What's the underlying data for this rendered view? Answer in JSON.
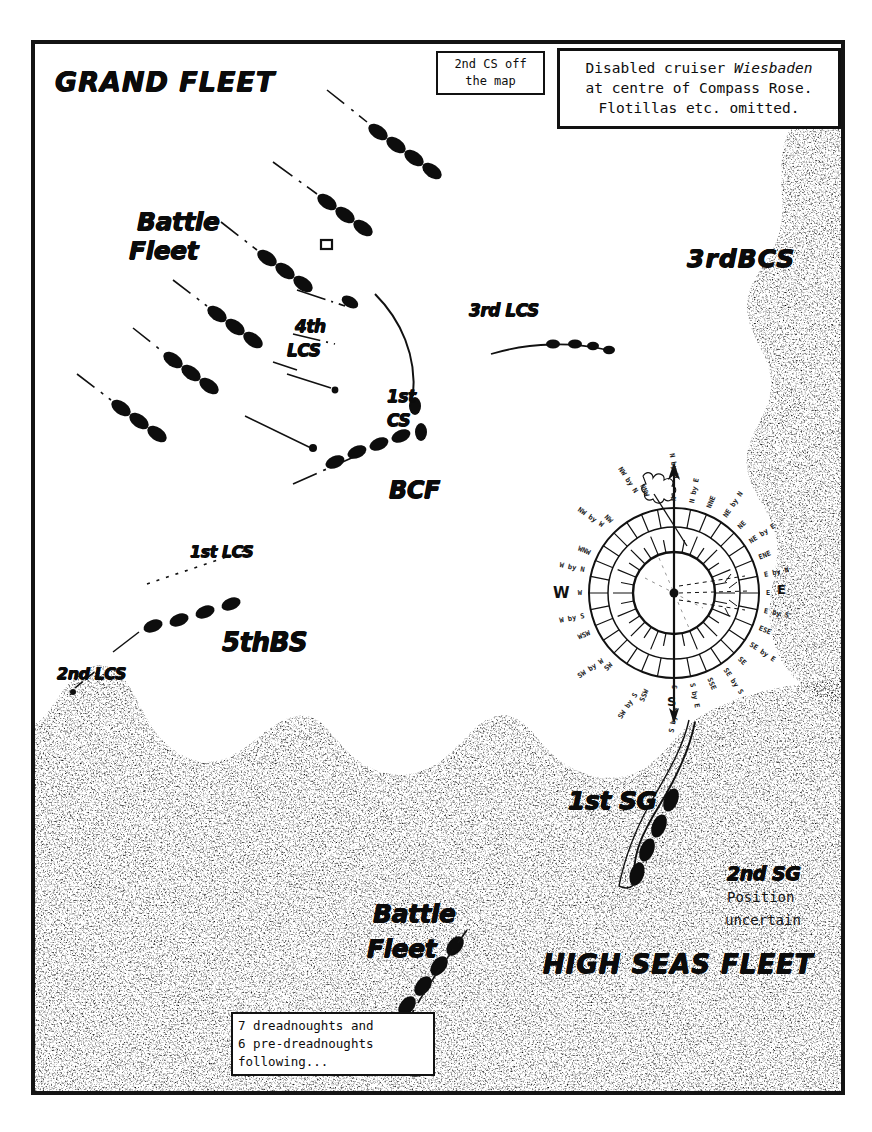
{
  "map": {
    "title": "Battle of Jutland fleet disposition map",
    "frame_color": "#141414",
    "paper_color": "#ffffff"
  },
  "notes": [
    {
      "id": "second-cs-note",
      "lines": [
        "2nd CS off",
        "the map"
      ]
    },
    {
      "id": "wiesbaden-note",
      "line1_pre": "Disabled cruiser ",
      "line1_italic": "Wiesbaden",
      "line2": "at centre of Compass Rose.",
      "line3": "Flotillas etc. omitted."
    },
    {
      "id": "dreadnoughts-note",
      "lines": [
        "7 dreadnoughts and",
        "6 pre-dreadnoughts",
        "following..."
      ]
    }
  ],
  "fleet_labels": {
    "grand_fleet": "GRAND FLEET",
    "high_seas_fleet": "HIGH SEAS FLEET",
    "battle_fleet_north": {
      "line1": "Battle",
      "line2": "Fleet"
    },
    "battle_fleet_south": {
      "line1": "Battle",
      "line2": "Fleet"
    }
  },
  "formation_labels": [
    {
      "name": "third-bcs",
      "text": "3rdBCS"
    },
    {
      "name": "third-lcs",
      "text": "3rd LCS"
    },
    {
      "name": "fourth-lcs-line1",
      "text": "4th"
    },
    {
      "name": "fourth-lcs-line2",
      "text": "LCS"
    },
    {
      "name": "first-cs-line1",
      "text": "1st"
    },
    {
      "name": "first-cs-line2",
      "text": "CS"
    },
    {
      "name": "bcf",
      "text": "BCF"
    },
    {
      "name": "first-lcs",
      "text": "1st LCS"
    },
    {
      "name": "fifth-bs",
      "text": "5thBS"
    },
    {
      "name": "second-lcs",
      "text": "2nd LCS"
    },
    {
      "name": "first-sg",
      "text": "1st SG"
    },
    {
      "name": "second-sg",
      "text": "2nd SG"
    }
  ],
  "second_sg_note": {
    "line1": "Position",
    "line2": "uncertain"
  },
  "compass_rose": {
    "centre_note": "Disabled cruiser Wiesbaden at centre",
    "cardinals": {
      "north": "N",
      "east": "E",
      "south": "S",
      "west": "W"
    },
    "points": [
      "N",
      "N by E",
      "NNE",
      "NE by N",
      "NE",
      "NE by E",
      "ENE",
      "E by N",
      "E",
      "E by S",
      "ESE",
      "SE by E",
      "SE",
      "SE by S",
      "SSE",
      "S by E",
      "S",
      "S by W",
      "SSW",
      "SW by S",
      "SW",
      "SW by W",
      "WSW",
      "W by S",
      "W",
      "W by N",
      "WNW",
      "NW by W",
      "NW",
      "NW by N",
      "NNW",
      "N by W"
    ]
  },
  "chart_data": {
    "type": "map",
    "regions": [
      {
        "name": "open-sea",
        "fill": "white"
      },
      {
        "name": "stippled-area",
        "fill": "stipple"
      }
    ]
  }
}
